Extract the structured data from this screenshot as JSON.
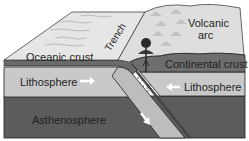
{
  "diagram": {
    "labels": {
      "oceanic_crust": "Oceanic crust",
      "trench": "Trench",
      "volcanic": "Volcanic",
      "arc": "arc",
      "continental_crust": "Continental crust",
      "lithosphere_left": "Lithosphere",
      "lithosphere_right": "Lithosphere",
      "asthenosphere": "Asthenosphere"
    },
    "arrows": {
      "left_lithosphere": "right",
      "right_lithosphere": "left",
      "subducting_slab": "down-right"
    },
    "colors": {
      "surface_light": "#e4e4e4",
      "crust_dark": "#6e6e6e",
      "lithosphere": "#c8c8c8",
      "asthenosphere": "#5c5c5c",
      "arc": "#dcdcdc",
      "volcano": "#2a2a2a"
    }
  }
}
